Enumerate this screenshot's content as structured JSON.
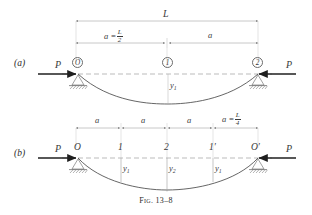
{
  "figure": {
    "caption_prefix": "Fig.",
    "caption_number": "13–8",
    "caption_full": "Fig. 13–8"
  },
  "panels": [
    {
      "id": "a",
      "label": "(a)",
      "span_label": "L",
      "dimensions": [
        {
          "name": "a-left",
          "label": "a = L/2",
          "expr_lead": "a =",
          "num": "L",
          "den": "2"
        },
        {
          "name": "a-right",
          "label": "a"
        }
      ],
      "loads": [
        {
          "name": "load-left",
          "label": "P",
          "direction": "right"
        },
        {
          "name": "load-right",
          "label": "P",
          "direction": "left"
        }
      ],
      "nodes": [
        {
          "name": "node-O",
          "label": "O",
          "circled": true
        },
        {
          "name": "node-1",
          "label": "1",
          "circled": true
        },
        {
          "name": "node-2",
          "label": "2",
          "circled": true
        }
      ],
      "deflections": [
        {
          "name": "deflection-y1",
          "symbol": "y",
          "subscript": "1"
        }
      ],
      "supports": [
        {
          "name": "support-left",
          "type": "pin-hatched"
        },
        {
          "name": "support-right",
          "type": "pin-hatched"
        }
      ]
    },
    {
      "id": "b",
      "label": "(b)",
      "dimensions": [
        {
          "name": "a-1",
          "label": "a"
        },
        {
          "name": "a-2",
          "label": "a"
        },
        {
          "name": "a-3",
          "label": "a"
        },
        {
          "name": "a-4",
          "label": "a = L/4",
          "expr_lead": "a =",
          "num": "L",
          "den": "4"
        }
      ],
      "loads": [
        {
          "name": "load-left",
          "label": "P",
          "direction": "right"
        },
        {
          "name": "load-right",
          "label": "P",
          "direction": "left"
        }
      ],
      "nodes": [
        {
          "name": "node-O",
          "label": "O",
          "circled": false
        },
        {
          "name": "node-1",
          "label": "1",
          "circled": false
        },
        {
          "name": "node-2",
          "label": "2",
          "circled": false
        },
        {
          "name": "node-1-prime",
          "label": "1′",
          "circled": false
        },
        {
          "name": "node-O-prime",
          "label": "O′",
          "circled": false
        }
      ],
      "deflections": [
        {
          "name": "deflection-y1",
          "symbol": "y",
          "subscript": "1"
        },
        {
          "name": "deflection-y2",
          "symbol": "y",
          "subscript": "2"
        },
        {
          "name": "deflection-y1-prime",
          "symbol": "y",
          "subscript": "1"
        }
      ],
      "supports": [
        {
          "name": "support-left",
          "type": "pin-hatched"
        },
        {
          "name": "support-right",
          "type": "pin-hatched"
        }
      ]
    }
  ],
  "colors": {
    "ink": "#2b2b2b",
    "line": "#555555",
    "thin": "#9a9a9a",
    "axis_dash": "#8d8d8d",
    "curve": "#4a4a4a",
    "paper": "#ffffff"
  }
}
